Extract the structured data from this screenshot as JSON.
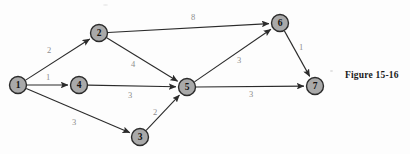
{
  "figure": {
    "caption": "Figure 15-16",
    "background_color": "#fdfdfd",
    "node_fill_color": "#a9a9a9",
    "node_stroke_color": "#2b2b2b",
    "edge_color": "#2b2b2b",
    "weight_label_color": "#8e8e8e"
  },
  "chart_data": {
    "type": "diagram",
    "subtype": "directed-weighted-network",
    "title": "Figure 15-16",
    "nodes": [
      {
        "id": "1",
        "label": "1",
        "x": 18,
        "y": 85
      },
      {
        "id": "2",
        "label": "2",
        "x": 99,
        "y": 33
      },
      {
        "id": "3",
        "label": "3",
        "x": 140,
        "y": 137
      },
      {
        "id": "4",
        "label": "4",
        "x": 79,
        "y": 85
      },
      {
        "id": "5",
        "label": "5",
        "x": 187,
        "y": 87
      },
      {
        "id": "6",
        "label": "6",
        "x": 280,
        "y": 23
      },
      {
        "id": "7",
        "label": "7",
        "x": 315,
        "y": 86
      }
    ],
    "node_radius": 8.5,
    "edges": [
      {
        "from": "1",
        "to": "2",
        "weight": "2",
        "lx": 49,
        "ly": 50
      },
      {
        "from": "1",
        "to": "4",
        "weight": "1",
        "lx": 48,
        "ly": 77
      },
      {
        "from": "1",
        "to": "3",
        "weight": "3",
        "lx": 74,
        "ly": 122
      },
      {
        "from": "2",
        "to": "6",
        "weight": "8",
        "lx": 193,
        "ly": 17
      },
      {
        "from": "2",
        "to": "5",
        "weight": "4",
        "lx": 133,
        "ly": 64
      },
      {
        "from": "4",
        "to": "5",
        "weight": "3",
        "lx": 130,
        "ly": 95
      },
      {
        "from": "3",
        "to": "5",
        "weight": "2",
        "lx": 155,
        "ly": 112
      },
      {
        "from": "5",
        "to": "6",
        "weight": "3",
        "lx": 239,
        "ly": 60
      },
      {
        "from": "5",
        "to": "7",
        "weight": "3",
        "lx": 251,
        "ly": 94
      },
      {
        "from": "6",
        "to": "7",
        "weight": "1",
        "lx": 301,
        "ly": 47
      }
    ],
    "directed": true,
    "xlabel": "",
    "ylabel": "",
    "legend": []
  }
}
